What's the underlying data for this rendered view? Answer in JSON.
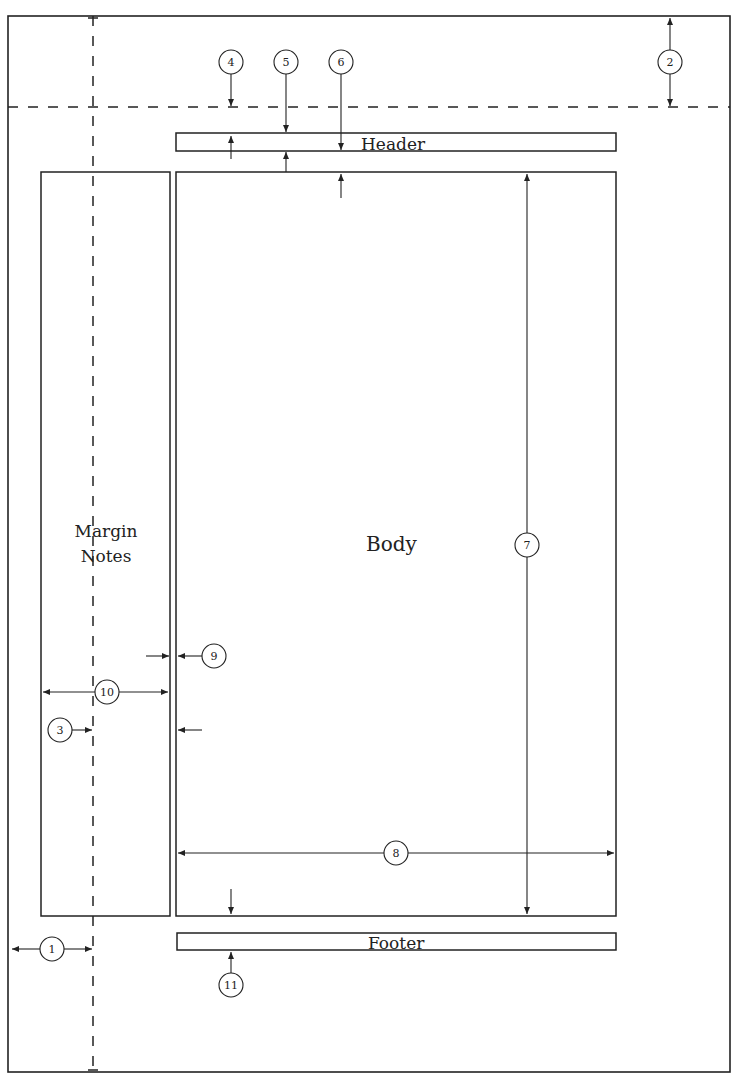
{
  "diagram": {
    "boxes": {
      "header": {
        "label": "Header"
      },
      "body": {
        "label": "Body"
      },
      "margin_notes": {
        "label_line1": "Margin",
        "label_line2": "Notes"
      },
      "footer": {
        "label": "Footer"
      }
    },
    "callouts": {
      "c1": "1",
      "c2": "2",
      "c3": "3",
      "c4": "4",
      "c5": "5",
      "c6": "6",
      "c7": "7",
      "c8": "8",
      "c9": "9",
      "c10": "10",
      "c11": "11"
    },
    "colors": {
      "line": "#222222",
      "background": "#ffffff"
    }
  }
}
